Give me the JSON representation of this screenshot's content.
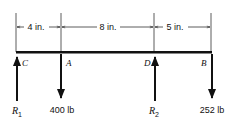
{
  "diagram": {
    "type": "beam-free-body",
    "dimensions": [
      {
        "label": "4 in.",
        "from": "C",
        "to": "A"
      },
      {
        "label": "8 in.",
        "from": "A",
        "to": "D"
      },
      {
        "label": "5 in.",
        "from": "D",
        "to": "B"
      }
    ],
    "points": [
      {
        "name": "C",
        "force_label": "R",
        "force_sub": "1",
        "direction": "up"
      },
      {
        "name": "A",
        "force_label": "400 lb",
        "direction": "down"
      },
      {
        "name": "D",
        "force_label": "R",
        "force_sub": "2",
        "direction": "up"
      },
      {
        "name": "B",
        "force_label": "252 lb",
        "direction": "down"
      }
    ]
  }
}
